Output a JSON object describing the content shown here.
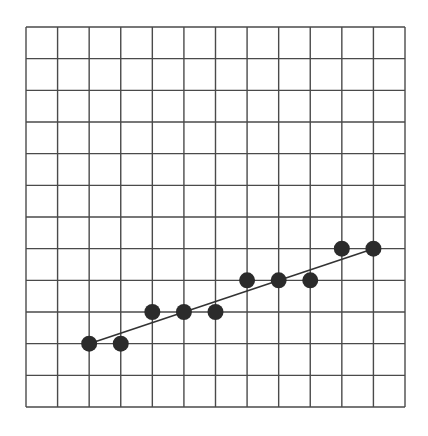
{
  "chart_data": {
    "type": "scatter",
    "title": "",
    "xlabel": "",
    "ylabel": "",
    "grid": true,
    "grid_cols": 12,
    "grid_rows": 12,
    "xlim": [
      0,
      12
    ],
    "ylim": [
      0,
      12
    ],
    "legend": null,
    "points": [
      {
        "x": 2,
        "y": 2
      },
      {
        "x": 3,
        "y": 2
      },
      {
        "x": 4,
        "y": 3
      },
      {
        "x": 5,
        "y": 3
      },
      {
        "x": 6,
        "y": 3
      },
      {
        "x": 7,
        "y": 4
      },
      {
        "x": 8,
        "y": 4
      },
      {
        "x": 9,
        "y": 4
      },
      {
        "x": 10,
        "y": 5
      },
      {
        "x": 11,
        "y": 5
      }
    ],
    "trend_line": {
      "from": {
        "x": 2,
        "y": 2
      },
      "to": {
        "x": 11,
        "y": 5
      }
    }
  },
  "style": {
    "background": "#ffffff",
    "grid_color": "#4a4a4a",
    "point_color": "#2b2b2b",
    "line_color": "#333333"
  },
  "layout": {
    "origin_x": 26,
    "origin_y": 407,
    "plot_width": 379,
    "plot_height": 380,
    "point_radius": 8
  }
}
